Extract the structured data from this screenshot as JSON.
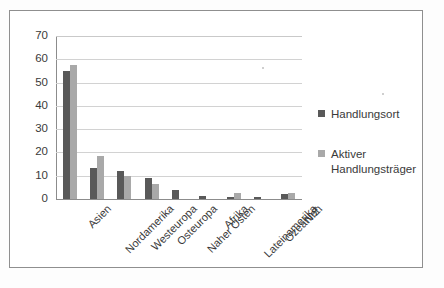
{
  "chart_data": {
    "type": "bar",
    "title": "",
    "subtitle": "",
    "xlabel": "",
    "ylabel": "",
    "ylim": [
      0,
      70
    ],
    "ytick_step": 10,
    "yticks": [
      "70",
      "60",
      "50",
      "40",
      "30",
      "20",
      "10",
      "0"
    ],
    "grid": "horizontal",
    "legend_position": "right",
    "categories": [
      "Asien",
      "Nordamerika",
      "Westeuropa",
      "Osteuropa",
      "Naher Osten",
      "Afrika",
      "Lateinamerika",
      "Ozeanien",
      "N.Z."
    ],
    "series": [
      {
        "name": "Handlungsort",
        "color": "#595959",
        "values": [
          55,
          13.5,
          12,
          9,
          4,
          1.5,
          1,
          1,
          2
        ]
      },
      {
        "name": "Aktiver Handlungsträger",
        "color": "#a9a9a9",
        "values": [
          57.5,
          18.5,
          10,
          6.5,
          0,
          0,
          2.5,
          0,
          2.5
        ]
      }
    ]
  },
  "legend": {
    "entries": [
      {
        "label": "Handlungsort",
        "color": "#595959"
      },
      {
        "label": "Aktiver Handlungsträger",
        "color": "#a9a9a9"
      }
    ]
  }
}
